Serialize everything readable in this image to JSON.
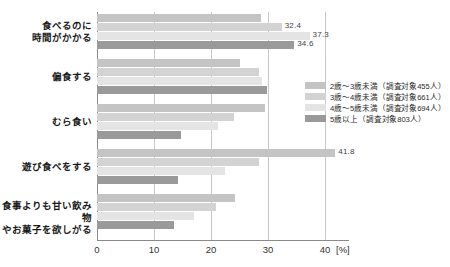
{
  "chart_data": {
    "type": "bar",
    "orientation": "horizontal",
    "title": "",
    "xlabel": "[%]",
    "ylabel": "",
    "xlim": [
      0,
      40
    ],
    "xticks": [
      0,
      10,
      20,
      30,
      40
    ],
    "xtick_labels": [
      "0",
      "10",
      "20",
      "30",
      "40"
    ],
    "unit": "[%]",
    "grid": true,
    "legend_position": "right-middle",
    "categories": [
      "食べるのに\n時間がかかる",
      "偏食する",
      "むら食い",
      "遊び食べをする",
      "食事よりも甘い飲み物\nやお菓子を欲しがる"
    ],
    "series": [
      {
        "name": "2歳～3歳未満（調査対象455人）",
        "short_name": "2歳～3歳未満",
        "sample_size": 455,
        "color": "#c4c4c4",
        "values": [
          28.8,
          25.0,
          29.5,
          41.8,
          24.2
        ]
      },
      {
        "name": "3歳～4歳未満（調査対象661人）",
        "short_name": "3歳～4歳未満",
        "sample_size": 661,
        "color": "#d3d3d3",
        "values": [
          32.4,
          28.4,
          24.0,
          28.4,
          20.8
        ]
      },
      {
        "name": "4歳～5歳未満（調査対象694人）",
        "short_name": "4歳～5歳未満",
        "sample_size": 694,
        "color": "#e4e4e4",
        "values": [
          37.3,
          28.9,
          21.3,
          22.5,
          17.0
        ]
      },
      {
        "name": "5歳以上（調査対象803人）",
        "short_name": "5歳以上",
        "sample_size": 803,
        "color": "#9a9a9a",
        "values": [
          34.6,
          29.9,
          14.8,
          14.2,
          13.5
        ]
      }
    ],
    "data_labels": [
      {
        "group": 0,
        "series": 1,
        "text": "32.4"
      },
      {
        "group": 0,
        "series": 2,
        "text": "37.3"
      },
      {
        "group": 0,
        "series": 3,
        "text": "34.6"
      },
      {
        "group": 3,
        "series": 0,
        "text": "41.8"
      }
    ]
  }
}
